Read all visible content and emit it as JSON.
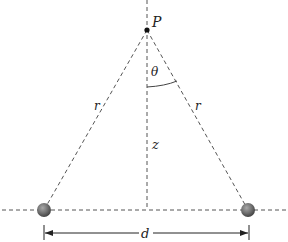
{
  "diagram": {
    "labels": {
      "point": "P",
      "angle": "θ",
      "left_distance": "r",
      "right_distance": "r",
      "height": "z",
      "separation": "d"
    },
    "colors": {
      "line": "#555555",
      "sphere": "#6e6e6e",
      "point": "#111111"
    },
    "geometry": {
      "P": [
        147,
        30
      ],
      "left_charge": [
        44,
        210
      ],
      "right_charge": [
        248,
        210
      ],
      "axis_base": [
        147,
        210
      ]
    }
  }
}
